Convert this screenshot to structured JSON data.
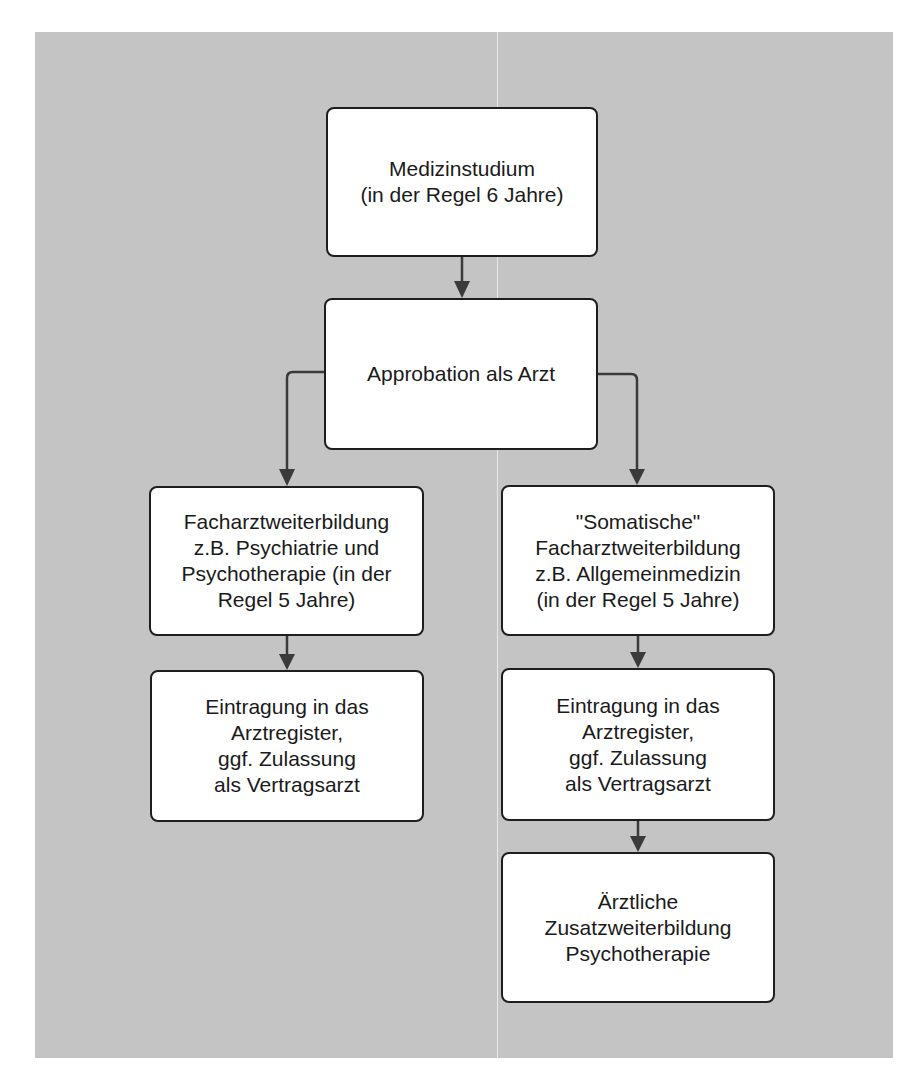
{
  "diagram": {
    "type": "flowchart",
    "nodes": [
      {
        "id": "medizinstudium",
        "label": "Medizinstudium\n(in der Regel 6 Jahre)"
      },
      {
        "id": "approbation",
        "label": "Approbation als Arzt"
      },
      {
        "id": "facharzt_psych",
        "label": "Facharztweiterbildung\nz.B. Psychiatrie und\nPsychotherapie (in der\nRegel 5 Jahre)"
      },
      {
        "id": "facharzt_somatisch",
        "label": "\"Somatische\"\nFacharztweiterbildung\nz.B. Allgemeinmedizin\n(in der Regel 5 Jahre)"
      },
      {
        "id": "eintragung_left",
        "label": "Eintragung in das\nArztregister,\nggf. Zulassung\nals Vertragsarzt"
      },
      {
        "id": "eintragung_right",
        "label": "Eintragung in das\nArztregister,\nggf. Zulassung\nals Vertragsarzt"
      },
      {
        "id": "zusatzweiterbildung",
        "label": "Ärztliche\nZusatzweiterbildung\nPsychotherapie"
      }
    ],
    "edges": [
      {
        "from": "medizinstudium",
        "to": "approbation"
      },
      {
        "from": "approbation",
        "to": "facharzt_psych"
      },
      {
        "from": "approbation",
        "to": "facharzt_somatisch"
      },
      {
        "from": "facharzt_psych",
        "to": "eintragung_left"
      },
      {
        "from": "facharzt_somatisch",
        "to": "eintragung_right"
      },
      {
        "from": "eintragung_right",
        "to": "zusatzweiterbildung"
      }
    ]
  },
  "colors": {
    "background": "#c4c4c4",
    "box_fill": "#ffffff",
    "box_border": "#1e1e1e",
    "arrow": "#3a3a3a",
    "text": "#1a1a1a"
  }
}
